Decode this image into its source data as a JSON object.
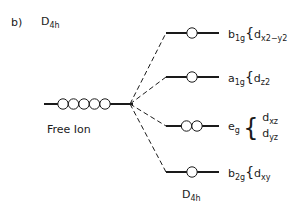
{
  "panel_label": "b)",
  "title": {
    "main": "D",
    "sub": "4h"
  },
  "free_ion": {
    "label": "Free Ion",
    "electrons": 5
  },
  "bottom_label": {
    "main": "D",
    "sub": "4h"
  },
  "levels": [
    {
      "symmetry": "b",
      "sub": "1g",
      "orbital": "d",
      "orbital_sub": "x2−y2",
      "electrons": 1
    },
    {
      "symmetry": "a",
      "sub": "1g",
      "orbital": "d",
      "orbital_sub": "z2",
      "electrons": 1
    },
    {
      "symmetry": "e",
      "sub": "g",
      "orbitals": [
        {
          "main": "d",
          "sub": "xz"
        },
        {
          "main": "d",
          "sub": "yz"
        }
      ],
      "electrons": 2
    },
    {
      "symmetry": "b",
      "sub": "2g",
      "orbital": "d",
      "orbital_sub": "xy",
      "electrons": 1
    }
  ]
}
